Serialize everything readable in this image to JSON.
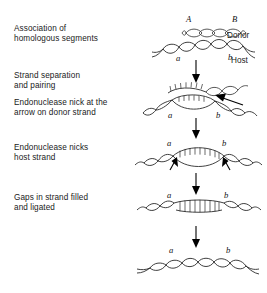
{
  "figure": {
    "background_color": "#ffffff",
    "line_color": "#2b2b2b",
    "width": 267,
    "height": 293
  },
  "steps": [
    {
      "id": "step-1",
      "caption": "Association of\nhomologous segments",
      "diagram": "two-separate-helices"
    },
    {
      "id": "step-2",
      "caption": "Strand separation\nand pairing",
      "diagram": "paired-bubble-with-nick-arrow"
    },
    {
      "id": "step-3",
      "caption": "Endonuclease nick at the\narrow on donor strand",
      "diagram": "paired-bubble-with-nick-arrow"
    },
    {
      "id": "step-4",
      "caption": "Endonuclease nicks\nhost strand",
      "diagram": "open-bubble-two-nick-arrows"
    },
    {
      "id": "step-5",
      "caption": "Gaps in strand filled\nand ligated",
      "diagram": "flattened-filled-ladder"
    }
  ],
  "panel_labels": {
    "donor_left": "A",
    "donor_right": "B",
    "host_left": "a",
    "host_right": "b",
    "donor_name": "Donor",
    "host_name": "Host"
  },
  "panels": [
    {
      "id": "panel-1",
      "name": "association-panel",
      "labels": [
        "A",
        "B",
        "a",
        "b",
        "Donor",
        "Host"
      ]
    },
    {
      "id": "panel-2",
      "name": "strand-separation-panel",
      "labels": [
        "a",
        "b"
      ]
    },
    {
      "id": "panel-3",
      "name": "host-nick-panel",
      "labels": [
        "a",
        "b"
      ]
    },
    {
      "id": "panel-4",
      "name": "gap-filled-panel",
      "labels": [
        "a",
        "b"
      ]
    },
    {
      "id": "panel-5",
      "name": "recombinant-panel",
      "labels": [
        "a",
        "b"
      ]
    }
  ],
  "flow_arrows": {
    "count": 4,
    "direction": "down"
  },
  "nick_arrows": {
    "donor_nick_label": "endonuclease nick site on donor strand",
    "host_nick_count": 2
  }
}
